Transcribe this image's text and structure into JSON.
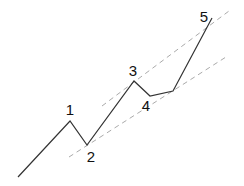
{
  "diagram": {
    "title": "",
    "type": "elliott-wave-impulse",
    "colors": {
      "wave": "#333333",
      "channel": "#aaaaaa",
      "label": "#111111"
    },
    "labels": [
      "1",
      "2",
      "3",
      "4",
      "5"
    ],
    "wave_points": [
      [
        18,
        177
      ],
      [
        70,
        121
      ],
      [
        87,
        145
      ],
      [
        134,
        81
      ],
      [
        150,
        96
      ],
      [
        173,
        91
      ],
      [
        212,
        18
      ]
    ],
    "channel_lines": [
      {
        "name": "upper",
        "from": [
          102,
          106
        ],
        "to": [
          229,
          11
        ]
      },
      {
        "name": "lower",
        "from": [
          69,
          157
        ],
        "to": [
          226,
          57
        ]
      }
    ],
    "label_positions": [
      [
        70,
        115
      ],
      [
        91,
        162
      ],
      [
        133,
        76
      ],
      [
        146,
        111
      ],
      [
        204,
        22
      ]
    ]
  }
}
